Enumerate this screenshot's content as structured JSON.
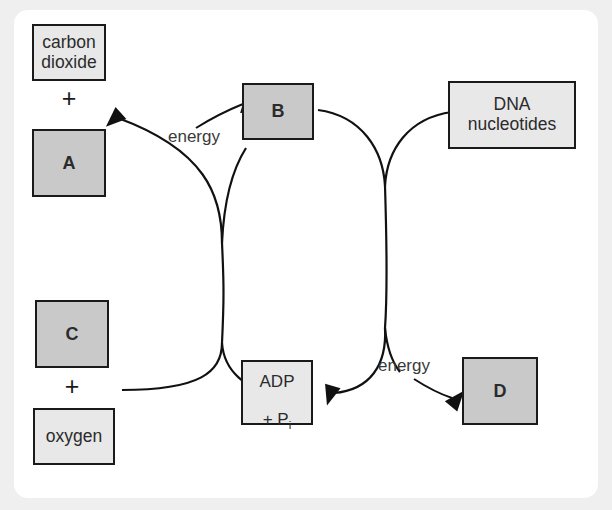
{
  "diagram": {
    "background_color": "#efefef",
    "card_color": "#ffffff",
    "box_fill_light": "#e8e8e8",
    "box_fill_gray": "#c9c9c9",
    "stroke_color": "#111111",
    "nodes": [
      {
        "id": "carbon_dioxide",
        "label": "carbon\ndioxide",
        "fill": "light",
        "kind": "word"
      },
      {
        "id": "a",
        "label": "A",
        "fill": "gray",
        "kind": "letter"
      },
      {
        "id": "c",
        "label": "C",
        "fill": "gray",
        "kind": "letter"
      },
      {
        "id": "oxygen",
        "label": "oxygen",
        "fill": "light",
        "kind": "word"
      },
      {
        "id": "b",
        "label": "B",
        "fill": "gray",
        "kind": "letter"
      },
      {
        "id": "adp",
        "label": "ADP\n+ Pi",
        "fill": "light",
        "kind": "word"
      },
      {
        "id": "dna",
        "label": "DNA\nnucleotides",
        "fill": "light",
        "kind": "word"
      },
      {
        "id": "d",
        "label": "D",
        "fill": "gray",
        "kind": "letter"
      }
    ],
    "adp_text": {
      "line1": "ADP",
      "line2_prefix": "+ P",
      "line2_subscript": "i"
    },
    "plus_symbols": [
      {
        "id": "plus-left-top",
        "label": "+"
      },
      {
        "id": "plus-left-bottom",
        "label": "+"
      }
    ],
    "energy_labels": [
      {
        "id": "energy-top",
        "label": "energy"
      },
      {
        "id": "energy-bottom",
        "label": "energy"
      }
    ]
  }
}
